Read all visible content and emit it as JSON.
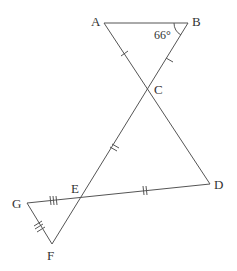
{
  "diagram": {
    "points": {
      "A": {
        "label": "A",
        "x": 104,
        "y": 23
      },
      "B": {
        "label": "B",
        "x": 188,
        "y": 23
      },
      "C": {
        "label": "C",
        "x": 148,
        "y": 89
      },
      "D": {
        "label": "D",
        "x": 210,
        "y": 184
      },
      "E": {
        "label": "E",
        "x": 81,
        "y": 197
      },
      "F": {
        "label": "F",
        "x": 52,
        "y": 244
      },
      "G": {
        "label": "G",
        "x": 27,
        "y": 203
      }
    },
    "angle_label": "66°",
    "segments": [
      "AB",
      "AD",
      "BF",
      "GD",
      "GF"
    ],
    "tick_marks": {
      "AC": 1,
      "BC": 1,
      "CE": 2,
      "ED": 2,
      "GE": 3,
      "GF": 3
    },
    "line_color": "#555555"
  }
}
